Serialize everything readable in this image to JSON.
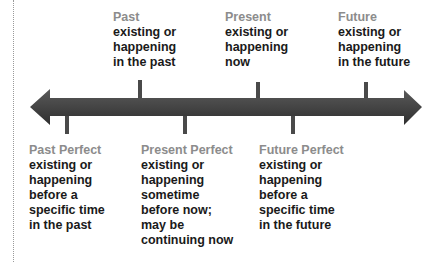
{
  "diagram": {
    "colors": {
      "arrow": "#4a4a4a",
      "arrow_shade": "#2e2e2e",
      "tick": "#4a4a4a",
      "term": "#8c8c8c",
      "definition": "#1a1a1a"
    },
    "above": [
      {
        "term": "Past",
        "definition": "existing or\nhappening\nin the past"
      },
      {
        "term": "Present",
        "definition": "existing or\nhappening\nnow"
      },
      {
        "term": "Future",
        "definition": "existing or\nhappening\nin the future"
      }
    ],
    "below": [
      {
        "term": "Past Perfect",
        "definition": "existing or\nhappening\nbefore a\nspecific time\nin the past"
      },
      {
        "term": "Present Perfect",
        "definition": "existing or\nhappening\nsometime\nbefore now;\nmay be\ncontinuing now"
      },
      {
        "term": "Future Perfect",
        "definition": "existing or\nhappening\nbefore a\nspecific time\nin the future"
      }
    ]
  }
}
